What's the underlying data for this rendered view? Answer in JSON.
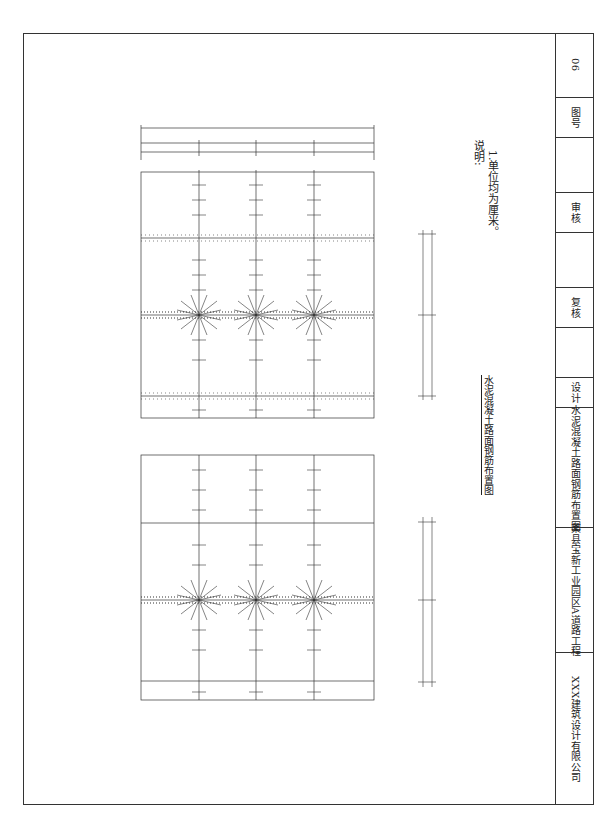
{
  "drawing": {
    "title": "水泥混凝土路面钢筋布置图",
    "notes": {
      "heading": "说明:",
      "items": [
        "1.单位均为厘米。"
      ]
    },
    "dimensions": {
      "overall": "1000",
      "lanes": [
        "375",
        "375",
        "375",
        "375"
      ],
      "bars": [
        "12×30",
        "12×30",
        "12×30",
        "12×30"
      ],
      "edges": [
        "15",
        "15",
        "15",
        "15"
      ],
      "right_upper": {
        "spacing": [
          "6×70",
          "6×70"
        ],
        "lengths": [
          "450",
          "450"
        ],
        "edges": [
          "15",
          "15",
          "15",
          "15"
        ]
      },
      "right_lower": {
        "spacing": [
          "6×70",
          "6×70"
        ],
        "lengths": [
          "450",
          "450"
        ],
        "edges": [
          "15",
          "15",
          "15",
          "15"
        ]
      }
    },
    "labels": {
      "lane": "行车道",
      "joint": "缩缝",
      "tie_bar": "拉杆",
      "dowel_bar": "传力杆",
      "construction_joint": "施工缝",
      "dowel_joint": "传力杆缩缝"
    }
  },
  "titleblock": {
    "company": "XXX建筑设计有限公司",
    "project": "某县宝新工业园区A道路工程",
    "sheet_title": "水泥混凝土路面钢筋布置图",
    "design": "设计",
    "review": "复核",
    "approve": "审核",
    "drawing_no_label": "图号",
    "drawing_no": "06"
  }
}
